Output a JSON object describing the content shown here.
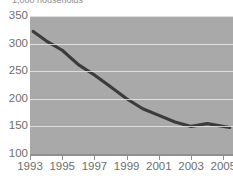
{
  "chart_data": {
    "type": "line",
    "title": "1,000 households",
    "xlabel": "",
    "ylabel": "",
    "xlim": [
      1993,
      2005.6
    ],
    "ylim": [
      100,
      350
    ],
    "grid": true,
    "legend": false,
    "y_ticks": [
      350,
      300,
      250,
      200,
      150,
      100
    ],
    "x_ticks": [
      1993,
      1995,
      1997,
      1999,
      2001,
      2003,
      2005
    ],
    "x_tick_labels": [
      "1993",
      "1995",
      "1997",
      "1999",
      "2001",
      "2003",
      "2005"
    ],
    "y_tick_labels": [
      "350",
      "300",
      "250",
      "200",
      "150",
      "100"
    ],
    "series": [
      {
        "name": "households",
        "color": "#3b3b3b",
        "x": [
          1993.2,
          1994,
          1995,
          1996,
          1997,
          1998,
          1999,
          2000,
          2001,
          2002,
          2003,
          2004,
          2005.4
        ],
        "values": [
          322,
          305,
          288,
          262,
          243,
          222,
          200,
          182,
          170,
          158,
          150,
          155,
          148
        ]
      }
    ],
    "colors": {
      "plot_background": "#a9a9a9",
      "gridline": "#e8e8e8",
      "line": "#3b3b3b",
      "axis": "#8f8f8f",
      "tick_label": "#6e6e6e",
      "title": "#8d8d8d",
      "page_background": "#ffffff"
    }
  }
}
